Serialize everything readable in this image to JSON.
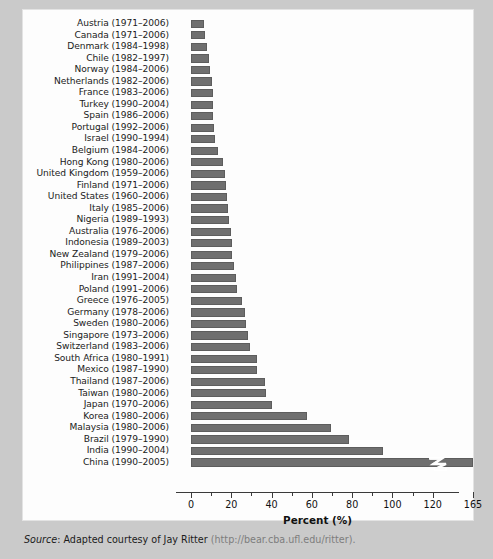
{
  "figure": {
    "background_color": "#cacaca",
    "panel_color": "#fdfdfd",
    "bar_color": "#6f6f6f"
  },
  "source": {
    "label": "Source",
    "separator": ": ",
    "text": "Adapted courtesy of Jay Ritter ",
    "url": "(http://bear.cba.ufl.edu/ritter)."
  },
  "chart_data": {
    "type": "bar",
    "orientation": "horizontal",
    "title": "",
    "xlabel": "Percent (%)",
    "ylabel": "",
    "xlim": [
      0,
      165
    ],
    "axis_break": {
      "present": true,
      "after": 120,
      "to": 165,
      "note": "final axis segment is compressed; China bar is clipped with a zigzag break mark"
    },
    "grid": false,
    "legend": false,
    "tick_labels": [
      "0",
      "20",
      "40",
      "60",
      "80",
      "100",
      "120",
      "165"
    ],
    "tick_values": [
      0,
      20,
      40,
      60,
      80,
      100,
      120,
      165
    ],
    "minor_tick_step": 10,
    "categories": [
      "Austria (1971–2006)",
      "Canada (1971–2006)",
      "Denmark  (1984–1998)",
      "Chile (1982–1997)",
      "Norway (1984–2006)",
      "Netherlands (1982–2006)",
      "France (1983–2006)",
      "Turkey (1990–2004)",
      "Spain (1986–2006)",
      "Portugal (1992–2006)",
      "Israel (1990–1994)",
      "Belgium (1984–2006)",
      "Hong Kong (1980–2006)",
      "United Kingdom (1959–2006)",
      "Finland (1971–2006)",
      "United States (1960–2006)",
      "Italy (1985–2006)",
      "Nigeria (1989–1993)",
      "Australia (1976–2006)",
      "Indonesia (1989–2003)",
      "New Zealand (1979–2006)",
      "Philippines (1987–2006)",
      "Iran (1991–2004)",
      "Poland (1991–2006)",
      "Greece (1976–2005)",
      "Germany (1978–2006)",
      "Sweden (1980–2006)",
      "Singapore (1973–2006)",
      "Switzerland (1983–2006)",
      "South Africa (1980–1991)",
      "Mexico (1987–1990)",
      "Thailand (1987–2006)",
      "Taiwan (1980–2006)",
      "Japan (1970–2006)",
      "Korea (1980–2006)",
      "Malaysia (1980–2006)",
      "Brazil (1979–1990)",
      "India (1990–2004)",
      "China (1990–2005)"
    ],
    "values": [
      6.3,
      7.1,
      8.1,
      8.8,
      9.6,
      10.2,
      10.7,
      10.8,
      10.9,
      11.6,
      12.1,
      13.5,
      15.9,
      16.8,
      17.2,
      18.0,
      18.2,
      19.1,
      19.8,
      20.2,
      20.3,
      21.2,
      22.4,
      22.9,
      25.1,
      26.9,
      27.3,
      28.3,
      29.3,
      32.7,
      33.0,
      36.6,
      37.2,
      40.2,
      57.4,
      69.6,
      78.5,
      95.4,
      164.5
    ],
    "value_unit": "%",
    "clipped_last_bar": true
  }
}
